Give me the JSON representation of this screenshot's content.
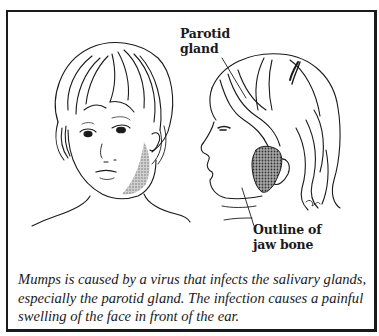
{
  "figure": {
    "illustrations": [
      {
        "name": "front-view-child-face",
        "description": "Front view of child with swollen left cheek (shaded)"
      },
      {
        "name": "side-view-child-face",
        "description": "Profile view of child with shaded parotid gland in front of ear"
      }
    ],
    "labels": {
      "parotid": [
        "Parotid",
        "gland"
      ],
      "jaw": [
        "Outline of",
        "jaw bone"
      ]
    },
    "caption": {
      "lines": [
        "Mumps is caused by a virus that infects the salivary glands,",
        "especially the parotid gland. The infection causes a painful",
        "swelling of the face in front of the ear."
      ]
    },
    "colors": {
      "ink": "#1a1a1a",
      "shading": "#9a9a9a",
      "background": "#ffffff"
    }
  }
}
